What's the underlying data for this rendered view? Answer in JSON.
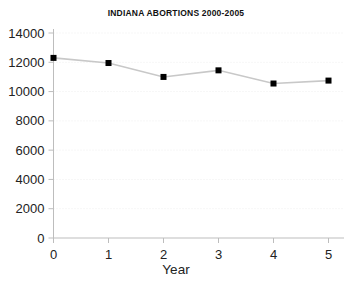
{
  "chart_data": {
    "type": "line",
    "title": "INDIANA ABORTIONS 2000-2005",
    "xlabel": "Year",
    "ylabel": "",
    "x": [
      0,
      1,
      2,
      3,
      4,
      5
    ],
    "values": [
      12300,
      11950,
      11000,
      11450,
      10550,
      10750
    ],
    "series": [
      {
        "name": "Indiana abortions",
        "values": [
          12300,
          11950,
          11000,
          11450,
          10550,
          10750
        ]
      }
    ],
    "xlim": [
      0,
      5
    ],
    "ylim": [
      0,
      14000
    ],
    "xticks": [
      "0",
      "1",
      "2",
      "3",
      "4",
      "5"
    ],
    "yticks": [
      "0",
      "2000",
      "4000",
      "6000",
      "8000",
      "10000",
      "12000",
      "14000"
    ],
    "ytick_values": [
      0,
      2000,
      4000,
      6000,
      8000,
      10000,
      12000,
      14000
    ],
    "grid": true,
    "grid_axis": "y",
    "grid_style": "dotted",
    "legend": false,
    "legend_position": "none",
    "marker": "square",
    "marker_color": "#000000",
    "line_color": "#c8c8c8",
    "axis_color": "#bdbdbd",
    "grid_color": "#eeeeee",
    "background_color": "#ffffff",
    "text_color": "#222222"
  },
  "axes": {
    "y_tick_labels": [
      "14000",
      "12000",
      "10000",
      "8000",
      "6000",
      "4000",
      "2000",
      "0"
    ],
    "x_tick_labels": [
      "0",
      "1",
      "2",
      "3",
      "4",
      "5"
    ],
    "x_axis_title": "Year"
  }
}
